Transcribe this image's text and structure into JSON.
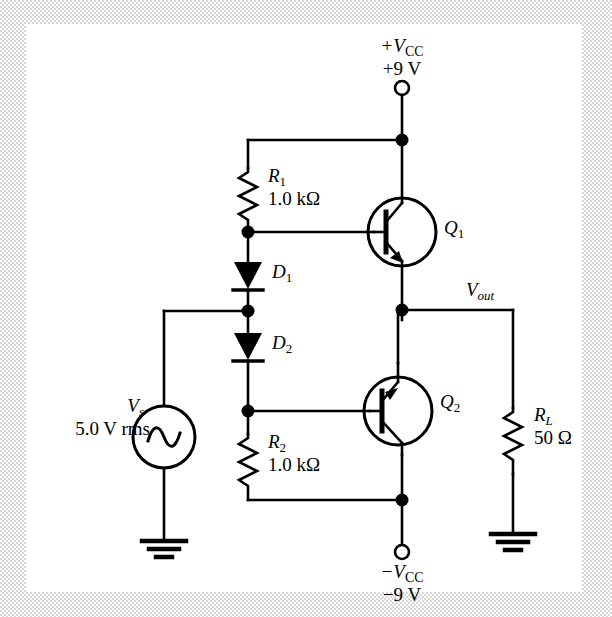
{
  "figure": {
    "type": "circuit-schematic",
    "canvas": {
      "width": 612,
      "height": 617,
      "background": "#ffffff",
      "border": "#d8d8d8"
    }
  },
  "supplies": {
    "positive": {
      "name": "+V",
      "name_sub": "CC",
      "value": "+9 V"
    },
    "negative": {
      "name": "−V",
      "name_sub": "CC",
      "value": "−9 V"
    }
  },
  "components": [
    {
      "id": "R1",
      "kind": "resistor",
      "ref": "R",
      "ref_sub": "1",
      "value": "1.0 kΩ"
    },
    {
      "id": "R2",
      "kind": "resistor",
      "ref": "R",
      "ref_sub": "2",
      "value": "1.0 kΩ"
    },
    {
      "id": "RL",
      "kind": "resistor",
      "ref": "R",
      "ref_sub": "L",
      "value": "50 Ω"
    },
    {
      "id": "D1",
      "kind": "diode",
      "ref": "D",
      "ref_sub": "1",
      "value": ""
    },
    {
      "id": "D2",
      "kind": "diode",
      "ref": "D",
      "ref_sub": "2",
      "value": ""
    },
    {
      "id": "Q1",
      "kind": "transistor-npn",
      "ref": "Q",
      "ref_sub": "1",
      "value": ""
    },
    {
      "id": "Q2",
      "kind": "transistor-pnp",
      "ref": "Q",
      "ref_sub": "2",
      "value": ""
    },
    {
      "id": "Vs",
      "kind": "ac-source",
      "ref": "V",
      "ref_sub": "s",
      "value": "5.0 V rms"
    }
  ],
  "labels": {
    "r1_ref": "R",
    "r1_sub": "1",
    "r1_value": "1.0 kΩ",
    "r2_ref": "R",
    "r2_sub": "2",
    "r2_value": "1.0 kΩ",
    "rl_ref": "R",
    "rl_sub": "L",
    "rl_value": "50 Ω",
    "d1_ref": "D",
    "d1_sub": "1",
    "d2_ref": "D",
    "d2_sub": "2",
    "q1_ref": "Q",
    "q1_sub": "1",
    "q2_ref": "Q",
    "q2_sub": "2",
    "vs_ref": "V",
    "vs_sub": "s",
    "vs_value": "5.0 V rms",
    "vout_ref": "V",
    "vout_sub": "out",
    "vcc_pos_ref": "+V",
    "vcc_pos_sub": "CC",
    "vcc_pos_value": "+9 V",
    "vcc_neg_ref": "−V",
    "vcc_neg_sub": "CC",
    "vcc_neg_value": "−9 V"
  },
  "nodes": [
    {
      "name": "vcc-positive-rail-junction",
      "x": 402,
      "y": 140
    },
    {
      "name": "q1-base-node",
      "x": 248,
      "y": 232
    },
    {
      "name": "diode-midpoint-node",
      "x": 248,
      "y": 311
    },
    {
      "name": "vout-node",
      "x": 402,
      "y": 310
    },
    {
      "name": "q2-base-node",
      "x": 248,
      "y": 411
    },
    {
      "name": "vcc-negative-rail-junction",
      "x": 402,
      "y": 500
    }
  ],
  "grounds": [
    {
      "name": "source-ground",
      "x": 164,
      "y": 540
    },
    {
      "name": "load-ground",
      "x": 513,
      "y": 533
    }
  ],
  "terminals": [
    {
      "name": "vcc-positive-terminal",
      "x": 402,
      "y": 88
    },
    {
      "name": "vcc-negative-terminal",
      "x": 402,
      "y": 552
    }
  ]
}
